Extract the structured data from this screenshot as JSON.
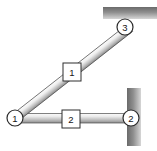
{
  "diagram": {
    "type": "structural-frame",
    "canvas": {
      "width": 157,
      "height": 151,
      "background": "#ffffff"
    },
    "colors": {
      "member_light": "#f2f2f2",
      "member_mid": "#c9c9c9",
      "member_dark": "#8a8a8a",
      "support_dark": "#6e6e6e",
      "support_light": "#d8d8d8",
      "outline": "#3a3a3a",
      "label_text": "#151515",
      "label_fill": "#ffffff"
    },
    "nodes": [
      {
        "id": "1",
        "label": "1",
        "x": 15,
        "y": 118,
        "r": 8,
        "role": "free-joint"
      },
      {
        "id": "2",
        "label": "2",
        "x": 131,
        "y": 118,
        "r": 8,
        "role": "wall-support"
      },
      {
        "id": "3",
        "label": "3",
        "x": 125,
        "y": 27,
        "r": 8,
        "role": "ceiling-support"
      }
    ],
    "elements": [
      {
        "id": "1",
        "label": "1",
        "from": "1",
        "to": "3",
        "orientation": "diagonal",
        "label_box": {
          "x": 63,
          "y": 63,
          "w": 18,
          "h": 18
        }
      },
      {
        "id": "2",
        "label": "2",
        "from": "1",
        "to": "2",
        "orientation": "horizontal",
        "label_box": {
          "x": 62,
          "y": 110,
          "w": 18,
          "h": 18
        }
      }
    ],
    "supports": [
      {
        "id": "ceiling-support",
        "kind": "horizontal-fixed-surface",
        "x": 103,
        "y": 7,
        "w": 54,
        "h": 12,
        "attached_node": "3"
      },
      {
        "id": "wall-support",
        "kind": "vertical-fixed-surface",
        "x": 127,
        "y": 88,
        "w": 14,
        "h": 58,
        "attached_node": "2"
      }
    ]
  }
}
